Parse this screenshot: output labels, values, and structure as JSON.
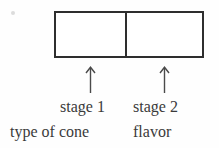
{
  "diagram": {
    "box": {
      "cells": [
        {
          "label": ""
        },
        {
          "label": ""
        }
      ],
      "border_color": "#2e2e2e",
      "fill_color": "#ffffff"
    },
    "arrows": [
      {
        "name": "arrow-stage-1",
        "direction": "up",
        "glyph": "↑"
      },
      {
        "name": "arrow-stage-2",
        "direction": "up",
        "glyph": "↑"
      }
    ],
    "stage_labels": [
      "stage 1",
      "stage 2"
    ],
    "stage_meanings": [
      "type of cone",
      "flavor"
    ],
    "text_color": "#3a3a3a",
    "background_color": "#fefefe"
  }
}
